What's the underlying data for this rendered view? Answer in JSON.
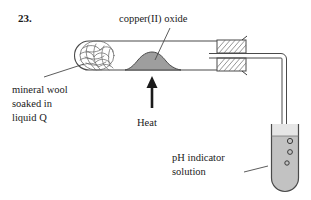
{
  "figure": {
    "number": "23.",
    "labels": {
      "copper_oxide": "copper(II) oxide",
      "mineral_wool_line1": "mineral wool",
      "mineral_wool_line2": "soaked in",
      "mineral_wool_line3": "liquid Q",
      "heat": "Heat",
      "ph_indicator_line1": "pH indicator",
      "ph_indicator_line2": "solution"
    },
    "colors": {
      "ink": "#1a1a1a",
      "outline": "#4a4a4a",
      "copper_oxide_fill": "#9e9e9e",
      "solution_fill": "#c2c2c2",
      "stopper_fill": "#ffffff",
      "background": "#ffffff"
    },
    "apparatus": {
      "test_tube_horizontal": "boiling tube heated horizontally",
      "mineral_wool": "mineral wool plug at sealed left end",
      "solid_sample": "copper(II) oxide mound in centre of tube",
      "heat_source": "heat applied from below at the solid",
      "stopper": "hatched bung at right end of tube",
      "delivery_tube": "bent delivery tube from bung into the solution",
      "collection_tube": "vertical test tube of pH indicator solution",
      "bubbles": "gas bubbles rising in the indicator solution"
    }
  }
}
